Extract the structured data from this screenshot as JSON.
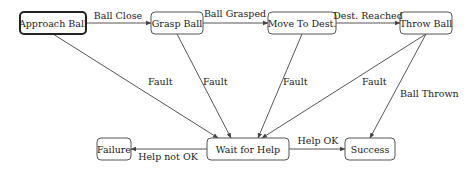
{
  "diagram": {
    "type": "state-machine",
    "nodes": [
      {
        "id": "approach",
        "label": "Approach Ball",
        "initial": true
      },
      {
        "id": "grasp",
        "label": "Grasp Ball",
        "initial": false
      },
      {
        "id": "move",
        "label": "Move To Dest.",
        "initial": false
      },
      {
        "id": "throw",
        "label": "Throw Ball",
        "initial": false
      },
      {
        "id": "failure",
        "label": "Failure",
        "initial": false
      },
      {
        "id": "wait",
        "label": "Wait for Help",
        "initial": false
      },
      {
        "id": "success",
        "label": "Success",
        "initial": false
      }
    ],
    "edges": [
      {
        "from": "approach",
        "to": "grasp",
        "label": "Ball Close"
      },
      {
        "from": "grasp",
        "to": "move",
        "label": "Ball Grasped"
      },
      {
        "from": "move",
        "to": "throw",
        "label": "Dest. Reached"
      },
      {
        "from": "approach",
        "to": "wait",
        "label": "Fault"
      },
      {
        "from": "grasp",
        "to": "wait",
        "label": "Fault"
      },
      {
        "from": "move",
        "to": "wait",
        "label": "Fault"
      },
      {
        "from": "throw",
        "to": "wait",
        "label": "Fault"
      },
      {
        "from": "throw",
        "to": "success",
        "label": "Ball Thrown"
      },
      {
        "from": "wait",
        "to": "success",
        "label": "Help OK"
      },
      {
        "from": "wait",
        "to": "failure",
        "label": "Help not OK"
      }
    ]
  }
}
